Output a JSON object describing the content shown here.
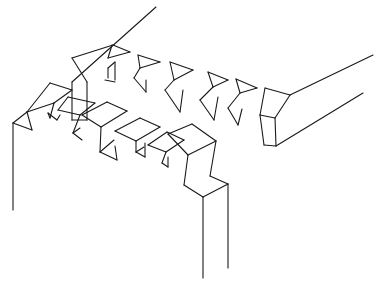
{
  "diagram": {
    "stroke_color": "#1a1a1a",
    "background": "#ffffff",
    "upper_board": {
      "edges": [
        [
          [
            72,
            82
          ],
          [
            156,
            7
          ]
        ],
        [
          [
            72,
            82
          ],
          [
            72,
            120
          ]
        ],
        [
          [
            72,
            58
          ],
          [
            113,
            45
          ]
        ],
        [
          [
            72,
            58
          ],
          [
            87,
            82
          ]
        ],
        [
          [
            87,
            82
          ],
          [
            87,
            120
          ]
        ],
        [
          [
            72,
            120
          ],
          [
            87,
            120
          ]
        ],
        [
          [
            113,
            45
          ],
          [
            130,
            52
          ]
        ],
        [
          [
            108,
            58
          ],
          [
            112,
            45
          ]
        ],
        [
          [
            108,
            58
          ],
          [
            130,
            52
          ]
        ],
        [
          [
            108,
            68
          ],
          [
            108,
            78
          ]
        ],
        [
          [
            108,
            68
          ],
          [
            115,
            62
          ]
        ],
        [
          [
            115,
            62
          ],
          [
            115,
            80
          ]
        ],
        [
          [
            105,
            80
          ],
          [
            115,
            82
          ]
        ],
        [
          [
            138,
            55
          ],
          [
            160,
            62
          ]
        ],
        [
          [
            138,
            55
          ],
          [
            140,
            68
          ]
        ],
        [
          [
            140,
            68
          ],
          [
            160,
            62
          ]
        ],
        [
          [
            134,
            78
          ],
          [
            140,
            68
          ]
        ],
        [
          [
            134,
            78
          ],
          [
            146,
            92
          ]
        ],
        [
          [
            146,
            92
          ],
          [
            146,
            80
          ]
        ],
        [
          [
            170,
            62
          ],
          [
            193,
            70
          ]
        ],
        [
          [
            170,
            62
          ],
          [
            174,
            80
          ]
        ],
        [
          [
            174,
            80
          ],
          [
            193,
            70
          ]
        ],
        [
          [
            165,
            90
          ],
          [
            174,
            80
          ]
        ],
        [
          [
            165,
            90
          ],
          [
            180,
            112
          ]
        ],
        [
          [
            180,
            112
          ],
          [
            183,
            90
          ]
        ],
        [
          [
            208,
            72
          ],
          [
            228,
            80
          ]
        ],
        [
          [
            208,
            72
          ],
          [
            213,
            87
          ]
        ],
        [
          [
            213,
            87
          ],
          [
            228,
            80
          ]
        ],
        [
          [
            200,
            100
          ],
          [
            213,
            87
          ]
        ],
        [
          [
            200,
            100
          ],
          [
            214,
            120
          ]
        ],
        [
          [
            214,
            120
          ],
          [
            218,
            97
          ]
        ],
        [
          [
            236,
            79
          ],
          [
            257,
            88
          ]
        ],
        [
          [
            236,
            79
          ],
          [
            240,
            93
          ]
        ],
        [
          [
            240,
            93
          ],
          [
            257,
            88
          ]
        ],
        [
          [
            228,
            108
          ],
          [
            240,
            93
          ]
        ],
        [
          [
            228,
            108
          ],
          [
            238,
            125
          ]
        ],
        [
          [
            238,
            125
          ],
          [
            242,
            109
          ]
        ],
        [
          [
            265,
            88
          ],
          [
            290,
            95
          ]
        ],
        [
          [
            265,
            88
          ],
          [
            260,
            115
          ]
        ],
        [
          [
            260,
            115
          ],
          [
            275,
            118
          ]
        ],
        [
          [
            275,
            118
          ],
          [
            290,
            95
          ]
        ],
        [
          [
            260,
            115
          ],
          [
            264,
            145
          ]
        ],
        [
          [
            275,
            118
          ],
          [
            276,
            146
          ]
        ],
        [
          [
            264,
            145
          ],
          [
            276,
            146
          ]
        ],
        [
          [
            290,
            95
          ],
          [
            373,
            55
          ]
        ],
        [
          [
            276,
            146
          ],
          [
            363,
            93
          ]
        ]
      ]
    },
    "lower_board": {
      "edges": [
        [
          [
            13,
            123
          ],
          [
            13,
            210
          ]
        ],
        [
          [
            13,
            123
          ],
          [
            27,
            112
          ]
        ],
        [
          [
            27,
            112
          ],
          [
            32,
            130
          ]
        ],
        [
          [
            13,
            123
          ],
          [
            32,
            130
          ]
        ],
        [
          [
            27,
            112
          ],
          [
            50,
            83
          ]
        ],
        [
          [
            50,
            83
          ],
          [
            72,
            90
          ]
        ],
        [
          [
            72,
            90
          ],
          [
            54,
            103
          ]
        ],
        [
          [
            27,
            112
          ],
          [
            54,
            103
          ]
        ],
        [
          [
            54,
            103
          ],
          [
            50,
            118
          ]
        ],
        [
          [
            50,
            118
          ],
          [
            48,
            113
          ]
        ],
        [
          [
            48,
            113
          ],
          [
            57,
            120
          ]
        ],
        [
          [
            57,
            120
          ],
          [
            60,
            115
          ]
        ],
        [
          [
            58,
            110
          ],
          [
            68,
            97
          ]
        ],
        [
          [
            68,
            97
          ],
          [
            95,
            103
          ]
        ],
        [
          [
            95,
            103
          ],
          [
            80,
            115
          ]
        ],
        [
          [
            58,
            110
          ],
          [
            80,
            115
          ]
        ],
        [
          [
            80,
            115
          ],
          [
            73,
            133
          ]
        ],
        [
          [
            73,
            133
          ],
          [
            82,
            140
          ]
        ],
        [
          [
            73,
            133
          ],
          [
            80,
            128
          ]
        ],
        [
          [
            82,
            115
          ],
          [
            107,
            102
          ]
        ],
        [
          [
            107,
            102
          ],
          [
            127,
            111
          ]
        ],
        [
          [
            127,
            111
          ],
          [
            101,
            127
          ]
        ],
        [
          [
            82,
            115
          ],
          [
            101,
            127
          ]
        ],
        [
          [
            101,
            127
          ],
          [
            100,
            152
          ]
        ],
        [
          [
            100,
            152
          ],
          [
            117,
            160
          ]
        ],
        [
          [
            100,
            152
          ],
          [
            114,
            140
          ]
        ],
        [
          [
            117,
            160
          ],
          [
            115,
            146
          ]
        ],
        [
          [
            115,
            131
          ],
          [
            140,
            118
          ]
        ],
        [
          [
            140,
            118
          ],
          [
            160,
            127
          ]
        ],
        [
          [
            160,
            127
          ],
          [
            136,
            141
          ]
        ],
        [
          [
            115,
            131
          ],
          [
            136,
            141
          ]
        ],
        [
          [
            136,
            141
          ],
          [
            136,
            152
          ]
        ],
        [
          [
            136,
            152
          ],
          [
            145,
            157
          ]
        ],
        [
          [
            136,
            152
          ],
          [
            144,
            147
          ]
        ],
        [
          [
            145,
            157
          ],
          [
            145,
            143
          ]
        ],
        [
          [
            148,
            145
          ],
          [
            167,
            132
          ]
        ],
        [
          [
            167,
            132
          ],
          [
            184,
            140
          ]
        ],
        [
          [
            184,
            140
          ],
          [
            166,
            152
          ]
        ],
        [
          [
            148,
            145
          ],
          [
            166,
            152
          ]
        ],
        [
          [
            166,
            152
          ],
          [
            162,
            163
          ]
        ],
        [
          [
            162,
            163
          ],
          [
            168,
            167
          ]
        ],
        [
          [
            168,
            167
          ],
          [
            168,
            157
          ]
        ],
        [
          [
            168,
            134
          ],
          [
            192,
            124
          ]
        ],
        [
          [
            192,
            124
          ],
          [
            216,
            141
          ]
        ],
        [
          [
            216,
            141
          ],
          [
            188,
            155
          ]
        ],
        [
          [
            168,
            134
          ],
          [
            188,
            155
          ]
        ],
        [
          [
            188,
            155
          ],
          [
            184,
            185
          ]
        ],
        [
          [
            216,
            141
          ],
          [
            210,
            176
          ]
        ],
        [
          [
            184,
            185
          ],
          [
            203,
            197
          ]
        ],
        [
          [
            210,
            176
          ],
          [
            228,
            184
          ]
        ],
        [
          [
            203,
            197
          ],
          [
            228,
            184
          ]
        ],
        [
          [
            203,
            197
          ],
          [
            203,
            278
          ]
        ],
        [
          [
            228,
            184
          ],
          [
            228,
            268
          ]
        ]
      ]
    }
  }
}
